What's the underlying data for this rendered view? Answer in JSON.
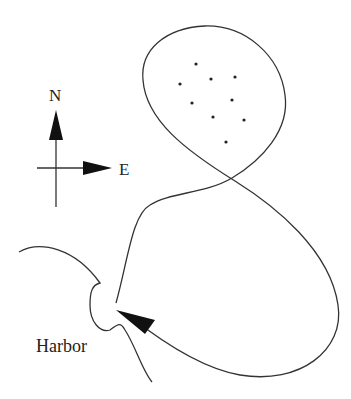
{
  "diagram": {
    "type": "route-map",
    "compass": {
      "north_label": "N",
      "east_label": "E"
    },
    "harbor_label": "Harbor",
    "colors": {
      "line": "#333333",
      "background": "#ffffff"
    },
    "dots": [
      [
        196,
        64
      ],
      [
        180,
        84
      ],
      [
        211,
        79
      ],
      [
        235,
        77
      ],
      [
        192,
        103
      ],
      [
        232,
        100
      ],
      [
        213,
        117
      ],
      [
        244,
        120
      ],
      [
        226,
        142
      ]
    ]
  }
}
